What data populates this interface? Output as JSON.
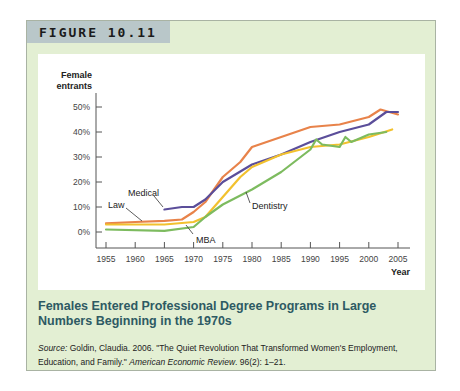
{
  "figure": {
    "label": "FIGURE 10.11",
    "caption_title": "Females Entered Professional Degree Programs in Large Numbers Beginning in the 1970s",
    "source_prefix": "Source:",
    "source_text": " Goldin, Claudia. 2006. \"The Quiet Revolution That Transformed Women's Employment, Education, and Family.\" ",
    "source_journal": "American Economic Review",
    "source_suffix": ". 96(2): 1–21."
  },
  "colors": {
    "frame_bg": "#e3efd3",
    "tab_bg": "#b9c7c9",
    "caption": "#2e5a63",
    "law": "#e8834a",
    "medical": "#5b4e9a",
    "mba": "#f2c12e",
    "dentistry": "#7dbb5f"
  },
  "chart_data": {
    "type": "line",
    "title": "",
    "ylabel": "Female entrants",
    "xlabel": "Year",
    "xlim": [
      1955,
      2005
    ],
    "ylim": [
      0,
      50
    ],
    "x_ticks": [
      1955,
      1960,
      1965,
      1970,
      1975,
      1980,
      1985,
      1990,
      1995,
      2000,
      2005
    ],
    "y_ticks": [
      "0%",
      "10%",
      "20%",
      "30%",
      "40%",
      "50%"
    ],
    "y_tick_values": [
      0,
      10,
      20,
      30,
      40,
      50
    ],
    "grid": false,
    "legend": "direct labels",
    "series": [
      {
        "name": "Law",
        "color": "#e8834a",
        "x": [
          1955,
          1960,
          1965,
          1968,
          1970,
          1972,
          1975,
          1978,
          1980,
          1985,
          1990,
          1995,
          2000,
          2002,
          2005
        ],
        "values": [
          3.5,
          4,
          4.5,
          5,
          8,
          12,
          22,
          28,
          34,
          38,
          42,
          43,
          46,
          49,
          47
        ]
      },
      {
        "name": "Medical",
        "color": "#5b4e9a",
        "x": [
          1965,
          1968,
          1970,
          1972,
          1975,
          1980,
          1985,
          1990,
          1995,
          2000,
          2003,
          2005
        ],
        "values": [
          9,
          10,
          10,
          13,
          20,
          27,
          31,
          36,
          40,
          43,
          48,
          48
        ]
      },
      {
        "name": "MBA",
        "color": "#f2c12e",
        "x": [
          1955,
          1965,
          1970,
          1972,
          1975,
          1978,
          1980,
          1985,
          1990,
          1995,
          2000,
          2004
        ],
        "values": [
          3,
          3,
          4,
          6,
          14,
          22,
          26,
          31,
          34,
          35,
          38,
          41
        ]
      },
      {
        "name": "Dentistry",
        "color": "#7dbb5f",
        "x": [
          1955,
          1965,
          1970,
          1972,
          1975,
          1980,
          1985,
          1990,
          1991,
          1992,
          1995,
          1996,
          1997,
          2000,
          2003
        ],
        "values": [
          1,
          0.5,
          2,
          6,
          11,
          17,
          24,
          33,
          37,
          35,
          34,
          38,
          36,
          39,
          40
        ]
      }
    ],
    "annotations": [
      {
        "text": "Medical",
        "x": 1962,
        "y": 17
      },
      {
        "text": "Law",
        "x": 1958,
        "y": 10
      },
      {
        "text": "MBA",
        "x": 1972,
        "y": -2
      },
      {
        "text": "Dentistry",
        "x": 1982,
        "y": 7
      }
    ]
  }
}
